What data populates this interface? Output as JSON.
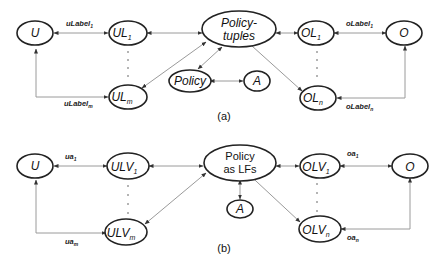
{
  "diagram_a": {
    "caption": "(a)",
    "nodes": {
      "U": {
        "label": "U"
      },
      "UL1": {
        "label": "UL",
        "sub": "1"
      },
      "ULm": {
        "label": "UL",
        "sub": "m"
      },
      "policy_tuples": {
        "line1": "Policy-",
        "line2": "tuples"
      },
      "policy": {
        "label": "Policy"
      },
      "A": {
        "label": "A"
      },
      "OL1": {
        "label": "OL",
        "sub": "1"
      },
      "OLn": {
        "label": "OL",
        "sub": "n"
      },
      "O": {
        "label": "O"
      }
    },
    "edge_labels": {
      "ulabel1": {
        "text": "uLabel",
        "sub": "1"
      },
      "ulabelm": {
        "text": "uLabel",
        "sub": "m"
      },
      "olabel1": {
        "text": "oLabel",
        "sub": "1"
      },
      "olabeln": {
        "text": "oLabel",
        "sub": "n"
      }
    }
  },
  "diagram_b": {
    "caption": "(b)",
    "nodes": {
      "U": {
        "label": "U"
      },
      "ULV1": {
        "label": "ULV",
        "sub": "1"
      },
      "ULVm": {
        "label": "ULV",
        "sub": "m"
      },
      "policy_lfs": {
        "line1": "Policy",
        "line2": "as LFs"
      },
      "A": {
        "label": "A"
      },
      "OLV1": {
        "label": "OLV",
        "sub": "1"
      },
      "OLVn": {
        "label": "OLV",
        "sub": "n"
      },
      "O": {
        "label": "O"
      }
    },
    "edge_labels": {
      "ua1": {
        "text": "ua",
        "sub": "1"
      },
      "uam": {
        "text": "ua",
        "sub": "m"
      },
      "oa1": {
        "text": "oa",
        "sub": "1"
      },
      "oan": {
        "text": "oa",
        "sub": "n"
      }
    }
  }
}
